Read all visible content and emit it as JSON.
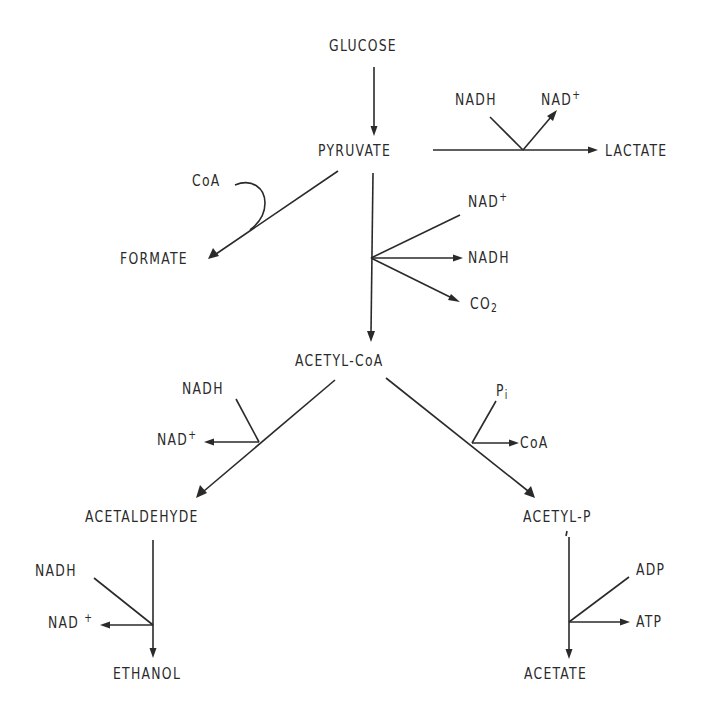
{
  "diagram": {
    "nodes": {
      "glucose": "GLUCOSE",
      "pyruvate": "PYRUVATE",
      "lactate": "LACTATE",
      "formate": "FORMATE",
      "acetyl_coa": "ACETYL-CoA",
      "acetaldehyde": "ACETALDEHYDE",
      "ethanol": "ETHANOL",
      "acetyl_p": "ACETYL-P",
      "acetate": "ACETATE"
    },
    "cofactors": {
      "lactate_step": {
        "in": "NADH",
        "out_base": "NAD",
        "out_sup": "+"
      },
      "formate_step": {
        "in": "CoA"
      },
      "pdh_step": {
        "in_base": "NAD",
        "in_sup": "+",
        "out1": "NADH",
        "out2_base": "CO",
        "out2_sub": "2"
      },
      "acetaldehyde_step": {
        "in": "NADH",
        "out_base": "NAD",
        "out_sup": "+"
      },
      "ethanol_step": {
        "in": "NADH",
        "out_base": "NAD",
        "out_sup": "+"
      },
      "acetyl_p_step": {
        "in_base": "P",
        "in_sub": "i",
        "out": "CoA"
      },
      "acetate_step": {
        "in": "ADP",
        "out": "ATP"
      }
    },
    "edges": [
      {
        "from": "GLUCOSE",
        "to": "PYRUVATE"
      },
      {
        "from": "PYRUVATE",
        "to": "LACTATE",
        "consumes": "NADH",
        "produces": "NAD+"
      },
      {
        "from": "PYRUVATE",
        "to": "FORMATE",
        "consumes": "CoA"
      },
      {
        "from": "PYRUVATE",
        "to": "ACETYL-CoA",
        "consumes": "NAD+",
        "produces": [
          "NADH",
          "CO2"
        ]
      },
      {
        "from": "ACETYL-CoA",
        "to": "ACETALDEHYDE",
        "consumes": "NADH",
        "produces": "NAD+"
      },
      {
        "from": "ACETALDEHYDE",
        "to": "ETHANOL",
        "consumes": "NADH",
        "produces": "NAD+"
      },
      {
        "from": "ACETYL-CoA",
        "to": "ACETYL-P",
        "consumes": "Pi",
        "produces": "CoA"
      },
      {
        "from": "ACETYL-P",
        "to": "ACETATE",
        "consumes": "ADP",
        "produces": "ATP"
      }
    ],
    "colors": {
      "ink": "#2a2a2a",
      "background": "#ffffff"
    }
  }
}
